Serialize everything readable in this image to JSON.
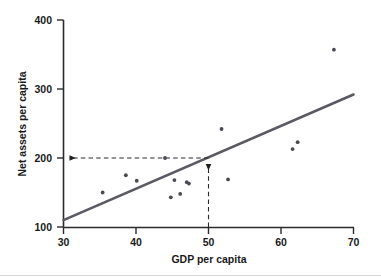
{
  "chart_data": {
    "type": "scatter",
    "title": "",
    "xlabel": "GDP per capita",
    "ylabel": "Net assets per capita",
    "xlim": [
      30,
      70
    ],
    "ylim": [
      100,
      400
    ],
    "xticks": [
      30,
      40,
      50,
      60,
      70
    ],
    "yticks": [
      100,
      200,
      300,
      400
    ],
    "xtick_labels": [
      "30",
      "40",
      "50",
      "60",
      "70"
    ],
    "ytick_labels": [
      "100",
      "200",
      "300",
      "400"
    ],
    "grid": false,
    "legend": null,
    "point_color": "#4a4a52",
    "line_color": "#5a5a62",
    "axis_color": "#2b2b2b",
    "points": [
      {
        "x": 35.4,
        "y": 150
      },
      {
        "x": 38.6,
        "y": 175
      },
      {
        "x": 40.1,
        "y": 167
      },
      {
        "x": 44.0,
        "y": 200
      },
      {
        "x": 44.8,
        "y": 143
      },
      {
        "x": 45.3,
        "y": 168
      },
      {
        "x": 46.1,
        "y": 148
      },
      {
        "x": 47.0,
        "y": 165
      },
      {
        "x": 47.3,
        "y": 163
      },
      {
        "x": 51.8,
        "y": 242
      },
      {
        "x": 52.7,
        "y": 169
      },
      {
        "x": 61.6,
        "y": 213
      },
      {
        "x": 62.3,
        "y": 223
      },
      {
        "x": 67.3,
        "y": 357
      }
    ],
    "trend_line": {
      "name": "regression-line",
      "x_start": 30,
      "y_start": 110,
      "x_end": 70,
      "y_end": 292
    },
    "annotations": {
      "horizontal_guide": {
        "label": "horizontal-dashed-guide",
        "y_value": 200,
        "x_from": 50,
        "x_to": 30,
        "arrow_at": "left"
      },
      "vertical_guide": {
        "label": "vertical-dashed-guide",
        "x_value": 50,
        "y_from": 100,
        "y_to": 200,
        "arrow_at": "top"
      }
    }
  }
}
